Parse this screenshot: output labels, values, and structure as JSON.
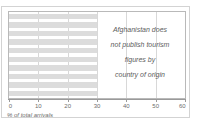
{
  "chart_data": {
    "type": "bar",
    "orientation": "horizontal",
    "title": "",
    "subtitle": "",
    "xlabel": "% of total arrivals",
    "ylabel": "",
    "xlim": [
      0,
      60
    ],
    "xticks": [
      0,
      10,
      20,
      30,
      40,
      50,
      60
    ],
    "xtick_labels": [
      "0",
      "10",
      "20",
      "30",
      "40",
      "50",
      "60"
    ],
    "grid": true,
    "grid_axis": "x",
    "legend": null,
    "bar_color": "#dcdcdc",
    "categories": [
      "",
      "",
      "",
      "",
      "",
      "",
      "",
      "",
      "",
      ""
    ],
    "values": [
      30,
      30,
      30,
      30,
      30,
      30,
      30,
      30,
      30,
      30
    ],
    "annotations": [
      {
        "text": "Afghanistan does not publish tourism figures by country of origin",
        "lines": [
          "Afghanistan does",
          "not publish tourism",
          "figures by",
          "country of origin"
        ],
        "style": "italic",
        "position": "center-right"
      }
    ]
  },
  "axis": {
    "title": "% of total arrivals",
    "ticks": [
      {
        "value": 0,
        "label": "0"
      },
      {
        "value": 10,
        "label": "10"
      },
      {
        "value": 20,
        "label": "20"
      },
      {
        "value": 30,
        "label": "30"
      },
      {
        "value": 40,
        "label": "40"
      },
      {
        "value": 50,
        "label": "50"
      },
      {
        "value": 60,
        "label": "60"
      }
    ]
  },
  "annotation": {
    "line1": "Afghanistan does",
    "line2": "not publish tourism",
    "line3": "figures by",
    "line4": "country of origin"
  },
  "colors": {
    "bar": "#dcdcdc",
    "gridline": "#d8d8d8",
    "axis": "#9a9a9a",
    "frame": "#b9b9b9",
    "outer_frame": "#d3d3d3",
    "text": "#5c5c5c",
    "background": "#ffffff"
  }
}
